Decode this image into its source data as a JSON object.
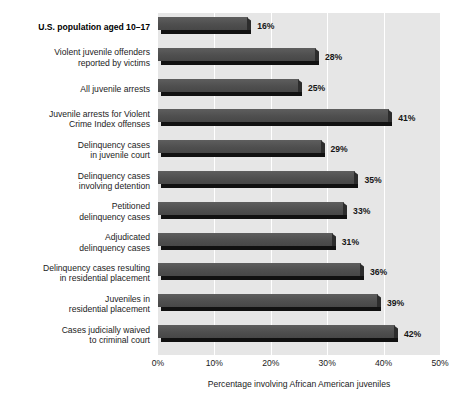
{
  "chart_data": {
    "type": "bar",
    "orientation": "horizontal",
    "title": "",
    "xlabel": "Percentage involving African American juveniles",
    "ylabel": "",
    "xlim": [
      0,
      50
    ],
    "xtick_labels": [
      "0%",
      "10%",
      "20%",
      "30%",
      "40%",
      "50%"
    ],
    "xtick_values": [
      0,
      10,
      20,
      30,
      40,
      50
    ],
    "grid": "vertical-white",
    "legend": "none",
    "categories": [
      "U.S. population aged 10–17",
      "Violent juvenile offenders\nreported by victims",
      "All juvenile arrests",
      "Juvenile arrests for Violent\nCrime Index offenses",
      "Delinquency cases\nin juvenile court",
      "Delinquency cases\ninvolving detention",
      "Petitioned\ndelinquency cases",
      "Adjudicated\ndelinquency cases",
      "Delinquency cases resulting\nin residential placement",
      "Juveniles in\nresidential placement",
      "Cases judicially waived\nto criminal court"
    ],
    "values": [
      16,
      28,
      25,
      41,
      29,
      35,
      33,
      31,
      36,
      39,
      42
    ],
    "value_labels": [
      "16%",
      "28%",
      "25%",
      "41%",
      "29%",
      "35%",
      "33%",
      "31%",
      "36%",
      "39%",
      "42%"
    ],
    "highlight_index": 0,
    "colors": {
      "bar_face": "#4f4f4f",
      "bar_shadow": "#111111",
      "plot_background": "#e6e6e6",
      "gridline": "#ffffff",
      "text": "#1b1b1b",
      "page_background": "#ffffff"
    }
  }
}
